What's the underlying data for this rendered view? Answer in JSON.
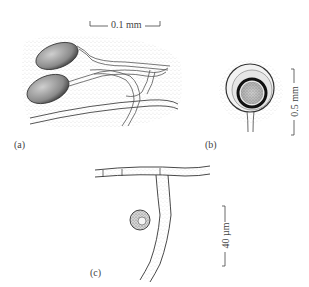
{
  "figure": {
    "panels": [
      {
        "id": "a",
        "label": "(a)",
        "scale_label": "0.1 mm"
      },
      {
        "id": "b",
        "label": "(b)",
        "scale_label": "0.5 mm"
      },
      {
        "id": "c",
        "label": "(c)",
        "scale_label": "40 µm"
      }
    ]
  }
}
